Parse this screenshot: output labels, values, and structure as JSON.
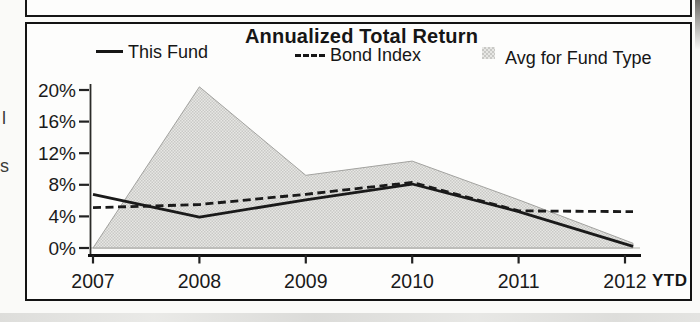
{
  "page": {
    "margin_fragments": [
      "l",
      "s"
    ]
  },
  "colors": {
    "ink": "#161616",
    "line_color": "#1a1a1a",
    "area_fill_light": "#e7e7e4",
    "area_fill_dark": "#c9c9c6",
    "area_edge": "#a3a3a0",
    "zero_gridline": "#c8c8c5",
    "panel_border": "#131313",
    "paper": "#fafaf8"
  },
  "chart_data": {
    "type": "line",
    "title": "Annualized Total Return",
    "categories": [
      "2007",
      "2008",
      "2009",
      "2010",
      "2011",
      "2012"
    ],
    "x_suffix_label": "YTD",
    "xlabel": "",
    "ylabel": "",
    "ylim": [
      0,
      21
    ],
    "y_tick_values": [
      0,
      4,
      8,
      12,
      16,
      20
    ],
    "y_tick_labels": [
      "0%",
      "4%",
      "8%",
      "12%",
      "16%",
      "20%"
    ],
    "grid": "0% baseline only",
    "legend_position": "top",
    "series": [
      {
        "name": "This Fund",
        "style": "solid-line",
        "color": "#1a1a1a",
        "values": [
          6.8,
          3.9,
          6.1,
          8.1,
          4.6,
          0.2
        ]
      },
      {
        "name": "Bond Index",
        "style": "dashed-line",
        "color": "#1a1a1a",
        "values": [
          5.1,
          5.5,
          6.8,
          8.3,
          4.7,
          4.6
        ]
      },
      {
        "name": "Avg for Fund Type",
        "style": "shaded-area",
        "color": "#d8d8d5",
        "values": [
          0.0,
          20.4,
          9.2,
          11.0,
          6.1,
          0.6
        ]
      }
    ]
  }
}
